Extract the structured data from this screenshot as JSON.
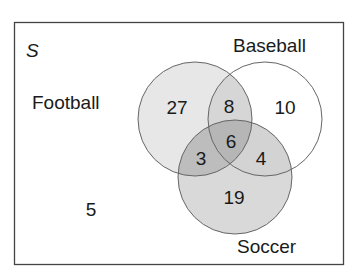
{
  "diagram": {
    "type": "venn",
    "universe_label": "S",
    "sets": [
      {
        "name": "Football",
        "fill": "#e6e6e6"
      },
      {
        "name": "Baseball",
        "fill": "#ffffff"
      },
      {
        "name": "Soccer",
        "fill": "#dadada"
      }
    ],
    "regions": {
      "football_only": "27",
      "baseball_only": "10",
      "soccer_only": "19",
      "football_baseball": "8",
      "football_soccer": "3",
      "baseball_soccer": "4",
      "all_three": "6",
      "none": "5"
    },
    "colors": {
      "stroke": "#555555",
      "frame": "#444444",
      "text": "#1a1a1a"
    }
  }
}
